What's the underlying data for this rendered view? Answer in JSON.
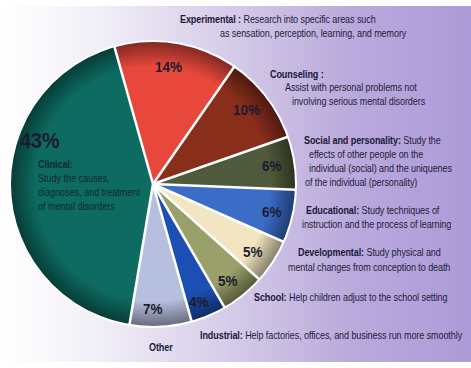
{
  "chart_data": {
    "type": "pie",
    "title": "",
    "categories": [
      "Clinical",
      "Experimental",
      "Counseling",
      "Social and personality",
      "Educational",
      "Developmental",
      "School",
      "Industrial",
      "Other"
    ],
    "values": [
      43,
      14,
      10,
      6,
      6,
      5,
      5,
      4,
      7
    ],
    "labels": [
      "43%",
      "14%",
      "10%",
      "6%",
      "6%",
      "5%",
      "5%",
      "4%",
      "7%"
    ],
    "colors": [
      "#0d6b62",
      "#e8483c",
      "#8a2e1c",
      "#4f5a3c",
      "#3a6cc8",
      "#f2e6c2",
      "#9aa06a",
      "#1c4fb4",
      "#b7bfe0"
    ],
    "start_angle_deg": -105.7,
    "direction": "clockwise",
    "legend_position": "annotations right of pie"
  },
  "slices": [
    {
      "name": "Clinical",
      "pct": "43%",
      "title": "Clinical:",
      "desc_lines": [
        "Study the causes,",
        "diagnoses, and treatment",
        "of mental disorders"
      ]
    },
    {
      "name": "Experimental",
      "pct": "14%",
      "title": "Experimental :",
      "desc_lines": [
        " Research into specific areas such",
        "as sensation, perception, learning, and memory"
      ]
    },
    {
      "name": "Counseling",
      "pct": "10%",
      "title": "Counseling :",
      "desc_lines": [
        "Assist with personal problems not",
        "involving serious mental disorders"
      ]
    },
    {
      "name": "Social and personality",
      "pct": "6%",
      "title": "Social and personality:",
      "desc_lines": [
        " Study the",
        "effects of other people on the",
        "individual (social) and the uniquenes",
        "of the individual (personality)"
      ]
    },
    {
      "name": "Educational",
      "pct": "6%",
      "title": "Educational:",
      "desc_lines": [
        " Study techniques of",
        "instruction and the process of learning"
      ]
    },
    {
      "name": "Developmental",
      "pct": "5%",
      "title": "Developmental:",
      "desc_lines": [
        " Study physical and",
        "mental changes from conception to death"
      ]
    },
    {
      "name": "School",
      "pct": "5%",
      "title": "School:",
      "desc_lines": [
        " Help children adjust to the school setting"
      ]
    },
    {
      "name": "Industrial",
      "pct": "4%",
      "title": "Industrial:",
      "desc_lines": [
        " Help factories, offices, and business run more smoothly"
      ]
    },
    {
      "name": "Other",
      "pct": "7%",
      "title": "Other",
      "desc_lines": []
    }
  ]
}
